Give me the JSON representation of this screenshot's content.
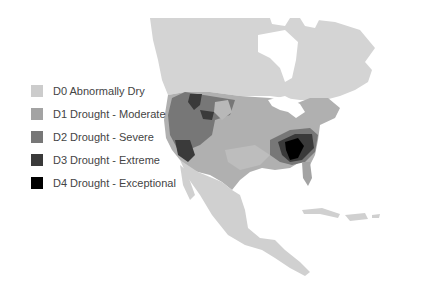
{
  "map": {
    "title": "",
    "region": "North America",
    "land_color": "#d2d2d2",
    "water_color": "#ffffff"
  },
  "legend": {
    "items": [
      {
        "code": "D0",
        "label": "D0 Abnormally Dry",
        "color": "#cccccc"
      },
      {
        "code": "D1",
        "label": "D1 Drought - Moderate",
        "color": "#a3a3a3"
      },
      {
        "code": "D2",
        "label": "D2 Drought - Severe",
        "color": "#777777"
      },
      {
        "code": "D3",
        "label": "D3 Drought - Extreme",
        "color": "#3a3a3a"
      },
      {
        "code": "D4",
        "label": "D4 Drought - Exceptional",
        "color": "#000000"
      }
    ]
  }
}
